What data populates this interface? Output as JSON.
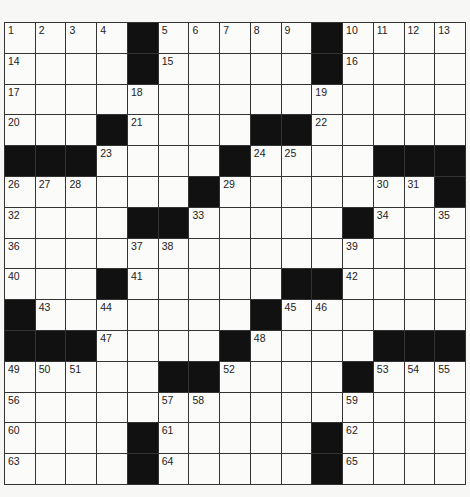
{
  "puzzle": {
    "size": 15,
    "rows": [
      [
        "1",
        "2",
        "3",
        "4",
        "#",
        "5",
        "6",
        "7",
        "8",
        "9",
        "#",
        "10",
        "11",
        "12",
        "13"
      ],
      [
        "14",
        "",
        "",
        "",
        "#",
        "15",
        "",
        "",
        "",
        "",
        "#",
        "16",
        "",
        "",
        ""
      ],
      [
        "17",
        "",
        "",
        "",
        "18",
        "",
        "",
        "",
        "",
        "",
        "19",
        "",
        "",
        "",
        ""
      ],
      [
        "20",
        "",
        "",
        "#",
        "21",
        "",
        "",
        "",
        "#",
        "#",
        "22",
        "",
        "",
        "",
        ""
      ],
      [
        "#",
        "#",
        "#",
        "23",
        "",
        "",
        "",
        "#",
        "24",
        "25",
        "",
        "",
        "#",
        "#",
        "#"
      ],
      [
        "26",
        "27",
        "28",
        "",
        "",
        "",
        "#",
        "29",
        "",
        "",
        "",
        "",
        "30",
        "31",
        "#"
      ],
      [
        "32",
        "",
        "",
        "",
        "#",
        "#",
        "33",
        "",
        "",
        "",
        "",
        "#",
        "34",
        "",
        "35"
      ],
      [
        "36",
        "",
        "",
        "",
        "37",
        "38",
        "",
        "",
        "",
        "",
        "",
        "39",
        "",
        "",
        ""
      ],
      [
        "40",
        "",
        "",
        "#",
        "41",
        "",
        "",
        "",
        "",
        "#",
        "#",
        "42",
        "",
        "",
        ""
      ],
      [
        "#",
        "43",
        "",
        "44",
        "",
        "",
        "",
        "",
        "#",
        "45",
        "46",
        "",
        "",
        "",
        ""
      ],
      [
        "#",
        "#",
        "#",
        "47",
        "",
        "",
        "",
        "#",
        "48",
        "",
        "",
        "",
        "#",
        "#",
        "#"
      ],
      [
        "49",
        "50",
        "51",
        "",
        "",
        "#",
        "#",
        "52",
        "",
        "",
        "",
        "#",
        "53",
        "54",
        "55"
      ],
      [
        "56",
        "",
        "",
        "",
        "",
        "57",
        "58",
        "",
        "",
        "",
        "",
        "59",
        "",
        "",
        ""
      ],
      [
        "60",
        "",
        "",
        "",
        "#",
        "61",
        "",
        "",
        "",
        "",
        "#",
        "62",
        "",
        "",
        ""
      ],
      [
        "63",
        "",
        "",
        "",
        "#",
        "64",
        "",
        "",
        "",
        "",
        "#",
        "65",
        "",
        "",
        ""
      ]
    ]
  }
}
